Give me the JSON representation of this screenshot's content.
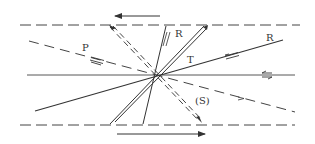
{
  "diagram": {
    "type": "fault-shear-model",
    "labels": {
      "p": "P",
      "r_upper": "R",
      "r_right": "R",
      "t": "T",
      "s": "(S)"
    },
    "colors": {
      "line": "#333333",
      "background": "#ffffff"
    },
    "elements": [
      {
        "name": "upper-boundary",
        "style": "dashed"
      },
      {
        "name": "lower-boundary",
        "style": "dashed"
      },
      {
        "name": "top-shear-arrow",
        "direction": "left"
      },
      {
        "name": "bottom-shear-arrow",
        "direction": "right"
      },
      {
        "name": "main-fault-line",
        "style": "solid"
      },
      {
        "name": "p-shear",
        "style": "dashed"
      },
      {
        "name": "r-shear-low-angle",
        "style": "solid"
      },
      {
        "name": "r-prime-shear-high-angle",
        "style": "solid"
      },
      {
        "name": "t-tension",
        "style": "double-solid"
      },
      {
        "name": "s-foliation",
        "style": "double-dashed"
      }
    ]
  }
}
